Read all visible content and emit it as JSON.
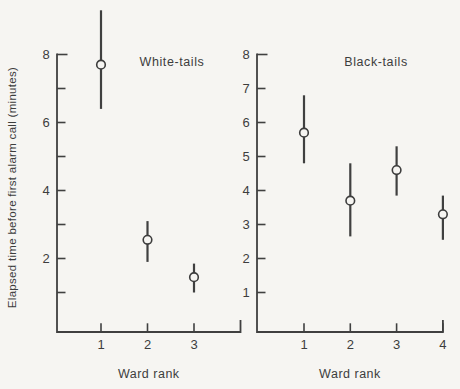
{
  "figure": {
    "background_color": "#f6f5f2",
    "ink_color": "#3d3d3d",
    "line_color": "#404040",
    "y_axis_label": "Elapsed time before first alarm call (minutes)",
    "x_axis_label": "Ward rank"
  },
  "chart_data": [
    {
      "type": "scatter",
      "title": "White-tails",
      "xlabel": "Ward rank",
      "ylabel": "Elapsed time before first alarm call (minutes)",
      "categories": [
        "1",
        "2",
        "3"
      ],
      "series": [
        {
          "name": "mean elapsed time with error bars",
          "values": [
            7.7,
            2.55,
            1.45
          ],
          "ci_low": [
            6.4,
            1.9,
            1.0
          ],
          "ci_high": [
            9.3,
            3.1,
            1.85
          ]
        }
      ],
      "ylim": [
        0,
        8
      ],
      "yticks": [
        1,
        2,
        3,
        4,
        5,
        6,
        7,
        8
      ],
      "ytick_labels": [
        "",
        "2",
        "",
        "4",
        "",
        "6",
        "",
        "8"
      ],
      "grid": false,
      "marker": "open-circle",
      "error_bars": true,
      "axis_end_hook": true,
      "legend": "none"
    },
    {
      "type": "scatter",
      "title": "Black-tails",
      "xlabel": "Ward rank",
      "ylabel": "",
      "categories": [
        "1",
        "2",
        "3",
        "4"
      ],
      "series": [
        {
          "name": "mean elapsed time with error bars",
          "values": [
            5.7,
            3.7,
            4.6,
            3.3
          ],
          "ci_low": [
            4.8,
            2.65,
            3.85,
            2.55
          ],
          "ci_high": [
            6.8,
            4.8,
            5.3,
            3.85
          ]
        }
      ],
      "ylim": [
        0,
        8
      ],
      "yticks": [
        1,
        2,
        3,
        4,
        5,
        6,
        7,
        8
      ],
      "ytick_labels": [
        "1",
        "2",
        "3",
        "4",
        "5",
        "6",
        "7",
        "8"
      ],
      "grid": false,
      "marker": "open-circle",
      "error_bars": true,
      "axis_end_hook": true,
      "legend": "none"
    }
  ]
}
